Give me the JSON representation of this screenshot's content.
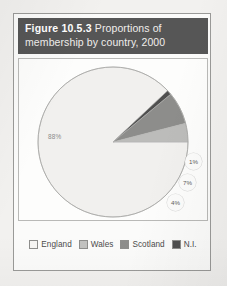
{
  "figure": {
    "caption_number": "Figure 10.5.3",
    "caption_rest": " Proportions of membership by country, 2000",
    "caption_full": "Figure 10.5.3 Proportions of membership by country, 2000"
  },
  "colors": {
    "caption_band": "#565656",
    "page_background": "#f2f1ef",
    "frame_border": "#9a9a98",
    "england": "#f1f0ee",
    "wales": "#bcbcba",
    "scotland": "#8d8d8b",
    "ni": "#4f4f4f"
  },
  "chart_data": {
    "type": "pie",
    "title": "Figure 10.5.3 Proportions of membership by country, 2000",
    "subtitle": "",
    "xlabel": "",
    "ylabel": "",
    "unit": "%",
    "legend_position": "bottom",
    "grid": false,
    "start_angle_deg": 0,
    "direction": "clockwise",
    "categories": [
      "England",
      "Wales",
      "Scotland",
      "N.I."
    ],
    "values": [
      88,
      4,
      7,
      1
    ],
    "slices": [
      {
        "name": "England",
        "value": 88,
        "label": "88%",
        "color": "#f1f0ee",
        "label_style": "plain",
        "label_x": 29,
        "label_y": 74
      },
      {
        "name": "N.I.",
        "value": 1,
        "label": "1%",
        "color": "#4f4f4f",
        "label_style": "bubble",
        "label_x": 166,
        "label_y": 94
      },
      {
        "name": "Scotland",
        "value": 7,
        "label": "7%",
        "color": "#8d8d8b",
        "label_style": "bubble",
        "label_x": 160,
        "label_y": 115
      },
      {
        "name": "Wales",
        "value": 4,
        "label": "4%",
        "color": "#bcbcba",
        "label_style": "bubble",
        "label_x": 148,
        "label_y": 135
      }
    ],
    "legend": [
      {
        "label": "England",
        "color": "#f6f5f3"
      },
      {
        "label": "Wales",
        "color": "#c2c2c0"
      },
      {
        "label": "Scotland",
        "color": "#8d8d8b"
      },
      {
        "label": "N.I.",
        "color": "#4f4f4f"
      }
    ]
  }
}
